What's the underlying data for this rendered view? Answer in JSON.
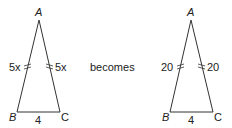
{
  "left_triangle": {
    "vertices": {
      "A": "A",
      "B": "B",
      "C": "C"
    },
    "side_AB": "5x",
    "side_AC": "5x",
    "side_BC": "4"
  },
  "connector": "becomes",
  "right_triangle": {
    "vertices": {
      "A": "A",
      "B": "B",
      "C": "C"
    },
    "side_AB": "20",
    "side_AC": "20",
    "side_BC": "4"
  },
  "colors": {
    "stroke": "#333333",
    "text": "#222222"
  }
}
